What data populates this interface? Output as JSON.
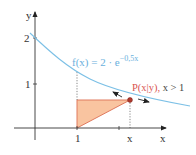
{
  "diagram": {
    "axes": {
      "x_label": "x",
      "y_label": "y",
      "y_ticks": [
        {
          "label": "2",
          "value": 2
        },
        {
          "label": "1",
          "value": 1
        }
      ],
      "x_ticks": [
        {
          "label": "1",
          "value": 1
        },
        {
          "label": "x",
          "value": "x"
        }
      ]
    },
    "function": {
      "label_main": "f(x) = 2 · e",
      "label_exponent": "−0,5x",
      "color": "#6ab0dd"
    },
    "point": {
      "label": "P(x|y),",
      "condition": "x > 1",
      "color": "#c0392b"
    },
    "triangle": {
      "fill": "#f7b98e",
      "stroke": "#e0705a"
    }
  }
}
